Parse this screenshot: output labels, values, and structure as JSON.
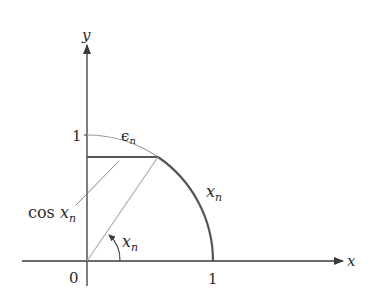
{
  "diagram": {
    "axes": {
      "x_label": "x",
      "y_label": "y",
      "origin_label": "0",
      "x_tick_label": "1",
      "y_tick_label": "1"
    },
    "labels": {
      "epsilon": "ϵ",
      "epsilon_sub": "n",
      "arc": "x",
      "arc_sub": "n",
      "cos_prefix": "cos ",
      "cos_var": "x",
      "cos_sub": "n",
      "angle": "x",
      "angle_sub": "n"
    },
    "colors": {
      "axis": "#3a3a3a",
      "thick_arc": "#555555",
      "thin_arc": "#9a9a9a",
      "radius": "#a8a8a8",
      "horizontal_segment": "#555555"
    }
  }
}
